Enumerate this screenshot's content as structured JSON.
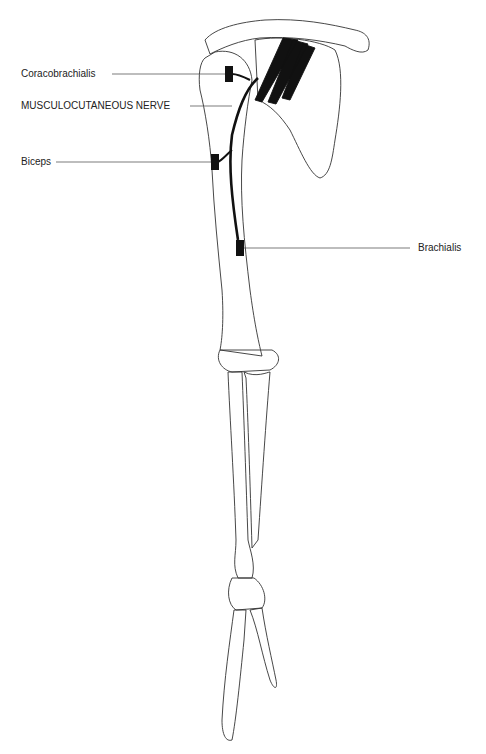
{
  "diagram": {
    "labels": [
      {
        "id": "coracobrachialis",
        "text": "Coracobrachialis"
      },
      {
        "id": "nerve",
        "text": "MUSCULOCUTANEOUS NERVE"
      },
      {
        "id": "biceps",
        "text": "Biceps"
      },
      {
        "id": "brachialis",
        "text": "Brachialis"
      }
    ],
    "colors": {
      "line": "#333333",
      "nerve": "#111111",
      "background": "#ffffff"
    }
  }
}
